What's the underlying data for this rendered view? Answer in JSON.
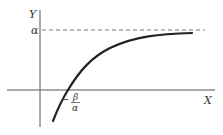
{
  "diagram": {
    "type": "function-graph",
    "axes": {
      "x_label": "X",
      "y_label": "Y"
    },
    "asymptote": {
      "label": "α",
      "style": "dashed",
      "description": "horizontal asymptote y = α"
    },
    "x_intercept": {
      "minus": "−",
      "numerator": "β",
      "denominator": "α"
    },
    "curve": {
      "description": "increasing concave curve approaching α, crossing x-axis at −β/α"
    },
    "colors": {
      "axis": "#555555",
      "curve": "#222222",
      "dashed": "#666666",
      "text": "#333333"
    }
  }
}
